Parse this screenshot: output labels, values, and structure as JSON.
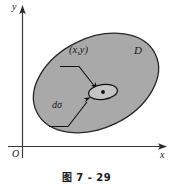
{
  "figure": {
    "caption": "图 7 - 29",
    "axes": {
      "y_label": "y",
      "x_label": "x",
      "origin_label": "O",
      "axis_color": "#3a3a3a"
    },
    "region": {
      "label": "D",
      "fill_color": "#a9a9a9",
      "stroke_color": "#262626"
    },
    "point": {
      "label": "(x,y)",
      "marker_color": "#111111"
    },
    "element": {
      "label": "dσ",
      "fill_color": "#c9c9c9",
      "stroke_color": "#111111"
    },
    "leaders": {
      "point_leader_name": "point-leader-line",
      "element_leader_name": "element-leader-line",
      "color": "#111111"
    }
  }
}
